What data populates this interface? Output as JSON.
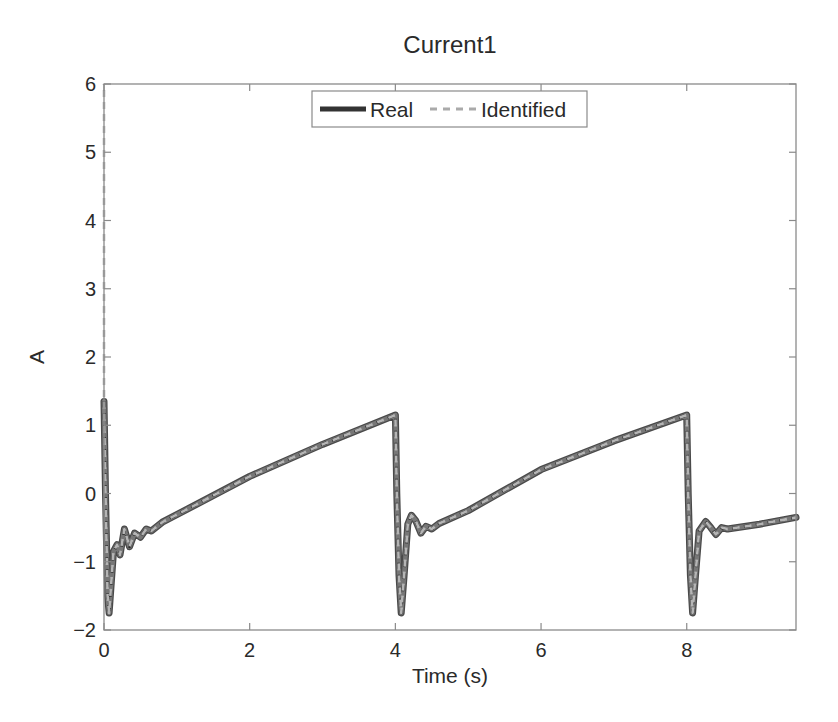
{
  "chart_data": {
    "type": "line",
    "title": "Current1",
    "xlabel": "Time (s)",
    "ylabel": "A",
    "xlim": [
      0,
      9.5
    ],
    "ylim": [
      -2,
      6
    ],
    "xticks": [
      0,
      2,
      4,
      6,
      8
    ],
    "xtick_labels": [
      "0",
      "2",
      "4",
      "6",
      "8"
    ],
    "yticks": [
      -2,
      -1,
      0,
      1,
      2,
      3,
      4,
      5,
      6
    ],
    "ytick_labels": [
      "−2",
      "−1",
      "0",
      "1",
      "2",
      "3",
      "4",
      "5",
      "6"
    ],
    "grid": false,
    "legend_position": "top-center",
    "series": [
      {
        "name": "Real",
        "style": "solid",
        "color": "#333333",
        "width": 5,
        "x": [
          0,
          0.02,
          0.05,
          0.07,
          0.1,
          0.13,
          0.18,
          0.22,
          0.28,
          0.35,
          0.42,
          0.5,
          0.58,
          0.65,
          0.8,
          1.32,
          2.0,
          3.0,
          4.0,
          4.02,
          4.05,
          4.08,
          4.12,
          4.17,
          4.22,
          4.28,
          4.35,
          4.42,
          4.5,
          4.6,
          5.0,
          6.0,
          7.0,
          8.0,
          8.02,
          8.05,
          8.08,
          8.12,
          8.17,
          8.26,
          8.33,
          8.4,
          8.48,
          8.56,
          9.0,
          9.5
        ],
        "y": [
          1.35,
          0.0,
          -1.5,
          -1.75,
          -1.3,
          -0.85,
          -0.75,
          -0.9,
          -0.52,
          -0.78,
          -0.58,
          -0.64,
          -0.52,
          -0.55,
          -0.42,
          -0.13,
          0.25,
          0.72,
          1.15,
          0.0,
          -1.2,
          -1.75,
          -1.2,
          -0.45,
          -0.32,
          -0.4,
          -0.58,
          -0.48,
          -0.52,
          -0.44,
          -0.25,
          0.35,
          0.77,
          1.15,
          0.0,
          -1.2,
          -1.75,
          -1.2,
          -0.55,
          -0.41,
          -0.5,
          -0.6,
          -0.5,
          -0.52,
          -0.45,
          -0.35
        ]
      },
      {
        "name": "Identified",
        "style": "dashed",
        "color": "#aaaaaa",
        "width": 3,
        "x": [
          0,
          0,
          0.02,
          0.05,
          0.07,
          0.1,
          0.13,
          0.18,
          0.22,
          0.28,
          0.35,
          0.42,
          0.5,
          0.58,
          0.65,
          0.8,
          1.32,
          2.0,
          3.0,
          4.0,
          4.02,
          4.05,
          4.08,
          4.12,
          4.17,
          4.22,
          4.28,
          4.35,
          4.42,
          4.5,
          4.6,
          5.0,
          6.0,
          7.0,
          8.0,
          8.02,
          8.05,
          8.08,
          8.12,
          8.17,
          8.26,
          8.33,
          8.4,
          8.48,
          8.56,
          9.0,
          9.5
        ],
        "y": [
          6.0,
          1.35,
          0.0,
          -1.5,
          -1.75,
          -1.3,
          -0.85,
          -0.75,
          -0.9,
          -0.52,
          -0.78,
          -0.58,
          -0.64,
          -0.52,
          -0.55,
          -0.42,
          -0.13,
          0.25,
          0.72,
          1.15,
          0.0,
          -1.2,
          -1.75,
          -1.2,
          -0.45,
          -0.32,
          -0.4,
          -0.58,
          -0.48,
          -0.52,
          -0.44,
          -0.25,
          0.35,
          0.77,
          1.15,
          0.0,
          -1.2,
          -1.75,
          -1.2,
          -0.55,
          -0.41,
          -0.5,
          -0.6,
          -0.5,
          -0.52,
          -0.45,
          -0.35
        ]
      }
    ]
  },
  "legend": {
    "items": [
      {
        "label": "Real"
      },
      {
        "label": "Identified"
      }
    ]
  }
}
